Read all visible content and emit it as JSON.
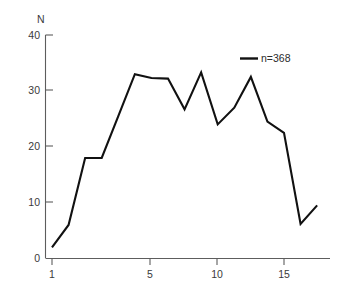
{
  "chart_data": {
    "type": "line",
    "title": "",
    "subtitle": "",
    "xlabel": "",
    "ylabel": "N",
    "xlim": [
      0.3,
      18.2
    ],
    "ylim": [
      0,
      40
    ],
    "grid": false,
    "legend_position": "top-right",
    "legend": [
      "n=368"
    ],
    "x_ticks": [
      1,
      5,
      10,
      15
    ],
    "x_tick_labels": [
      "1",
      "5",
      "10",
      "15"
    ],
    "y_ticks": [
      0,
      10,
      20,
      30,
      40
    ],
    "y_tick_labels": [
      "0",
      "10",
      "20",
      "30",
      "40"
    ],
    "series": [
      {
        "name": "n=368",
        "color": "#111111",
        "x": [
          1,
          2,
          3,
          4,
          5,
          6,
          7,
          8,
          9,
          10,
          11,
          12,
          13,
          14,
          15,
          16,
          17
        ],
        "values": [
          2,
          6,
          18,
          18,
          25.5,
          33,
          32.3,
          32.2,
          26.7,
          33.3,
          24,
          27,
          32.5,
          24.5,
          22.5,
          6.2,
          9.5
        ]
      }
    ]
  },
  "axis": {
    "y_title": "N"
  },
  "legend": {
    "entry_label": "n=368"
  }
}
